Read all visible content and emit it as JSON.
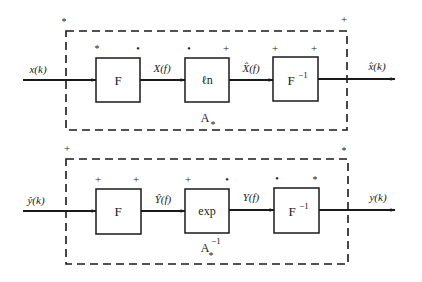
{
  "diagrams": [
    {
      "id": "forward",
      "system_label": "A",
      "system_subscript": "*",
      "system_superscript": "",
      "corner_marks": {
        "top_left": "*",
        "top_right": "+"
      },
      "input": {
        "label": "x(k)"
      },
      "output": {
        "label": "x̂(k)"
      },
      "blocks": [
        {
          "label": "F",
          "superscript": "",
          "marks": [
            "*",
            "•"
          ]
        },
        {
          "label": "ℓn",
          "superscript": "",
          "marks": [
            "•",
            "+"
          ]
        },
        {
          "label": "F",
          "superscript": "−1",
          "marks": [
            "+",
            "+"
          ]
        }
      ],
      "signals": [
        {
          "label": "X(f)"
        },
        {
          "label": "X̂(f)"
        }
      ]
    },
    {
      "id": "inverse",
      "system_label": "A",
      "system_subscript": "*",
      "system_superscript": "−1",
      "corner_marks": {
        "top_left": "+",
        "top_right": "*"
      },
      "input": {
        "label": "ŷ(k)"
      },
      "output": {
        "label": "y(k)"
      },
      "blocks": [
        {
          "label": "F",
          "superscript": "",
          "marks": [
            "+",
            "+"
          ]
        },
        {
          "label": "exp",
          "superscript": "",
          "marks": [
            "+",
            "•"
          ]
        },
        {
          "label": "F",
          "superscript": "−1",
          "marks": [
            "•",
            "*"
          ]
        }
      ],
      "signals": [
        {
          "label": "Ŷ(f)"
        },
        {
          "label": "Y(f)"
        }
      ]
    }
  ],
  "colors": {
    "ink": "#1a1a1a",
    "background": "#ffffff"
  }
}
